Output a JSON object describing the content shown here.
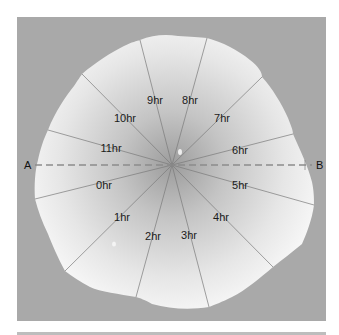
{
  "diagram": {
    "type": "radial-sector-diagram",
    "panel": {
      "background": "#a9a9a9",
      "x": 17,
      "y": 17,
      "width": 309,
      "height": 304
    },
    "center": {
      "x": 172,
      "y": 165
    },
    "blob": {
      "fill_center": "#9a9a9a",
      "fill_edge": "#f4f4f4"
    },
    "axis": {
      "start_label": "A",
      "end_label": "B",
      "style": "dashed",
      "color": "#8c8c8c"
    },
    "rays": [
      {
        "label": "0hr",
        "end": [
          35,
          199
        ],
        "label_pos": [
          104,
          186
        ]
      },
      {
        "label": "1hr",
        "end": [
          65,
          271
        ],
        "label_pos": [
          122,
          218
        ]
      },
      {
        "label": "2hr",
        "end": [
          136,
          297
        ],
        "label_pos": [
          153,
          237
        ]
      },
      {
        "label": "3hr",
        "end": [
          209,
          307
        ],
        "label_pos": [
          189,
          236
        ]
      },
      {
        "label": "4hr",
        "end": [
          273,
          267
        ],
        "label_pos": [
          221,
          218
        ]
      },
      {
        "label": "5hr",
        "end": [
          314,
          205
        ],
        "label_pos": [
          240,
          186
        ]
      },
      {
        "label": "6hr",
        "end": [
          293,
          134
        ],
        "label_pos": [
          240,
          151
        ]
      },
      {
        "label": "7hr",
        "end": [
          262,
          77
        ],
        "label_pos": [
          222,
          119
        ]
      },
      {
        "label": "8hr",
        "end": [
          207,
          38
        ],
        "label_pos": [
          190,
          101
        ]
      },
      {
        "label": "9hr",
        "end": [
          140,
          40
        ],
        "label_pos": [
          155,
          101
        ]
      },
      {
        "label": "10hr",
        "end": [
          82,
          74
        ],
        "label_pos": [
          125,
          119
        ]
      },
      {
        "label": "11hr",
        "end": [
          48,
          130
        ],
        "label_pos": [
          111,
          149
        ]
      }
    ]
  }
}
